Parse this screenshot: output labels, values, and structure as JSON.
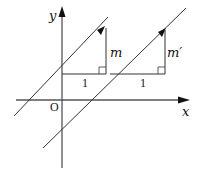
{
  "diagram": {
    "axes": {
      "x_label": "x",
      "y_label": "y",
      "origin_label": "O"
    },
    "lines": [
      {
        "name": "line-1",
        "slope_label": "m",
        "run_label": "1"
      },
      {
        "name": "line-2",
        "slope_label": "m′",
        "run_label": "1"
      }
    ],
    "colors": {
      "stroke": "#333333",
      "axis": "#555555"
    }
  }
}
